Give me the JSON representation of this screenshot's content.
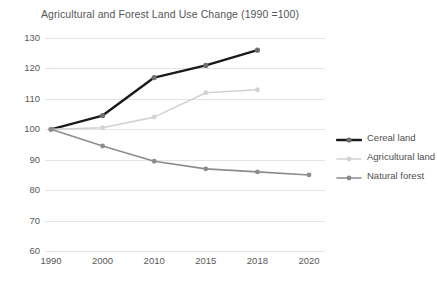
{
  "chart_data": {
    "type": "line",
    "title": "Agricultural and Forest Land Use Change (1990 =100)",
    "xlabel": "",
    "ylabel": "",
    "categories": [
      "1990",
      "2000",
      "2010",
      "2015",
      "2018",
      "2020"
    ],
    "x_positions": [
      1990,
      2000,
      2010,
      2015,
      2018,
      2020
    ],
    "ylim": [
      60,
      130
    ],
    "yticks": [
      60,
      70,
      80,
      90,
      100,
      110,
      120,
      130
    ],
    "grid": "horizontal",
    "legend_position": "right",
    "series": [
      {
        "name": "Cereal land",
        "color": "#1a1a1a",
        "values": [
          100,
          104.5,
          117,
          121,
          126,
          null
        ]
      },
      {
        "name": "Agricultural land",
        "color": "#d2d2d2",
        "values": [
          100,
          100.5,
          104,
          112,
          113,
          null
        ]
      },
      {
        "name": "Natural forest",
        "color": "#8c8c8c",
        "values": [
          100,
          94.5,
          89.5,
          87,
          86,
          85
        ]
      }
    ]
  },
  "legend": {
    "items": [
      {
        "label": "Cereal land",
        "color": "#1a1a1a"
      },
      {
        "label": "Agricultural land",
        "color": "#d2d2d2"
      },
      {
        "label": "Natural forest",
        "color": "#8c8c8c"
      }
    ]
  }
}
